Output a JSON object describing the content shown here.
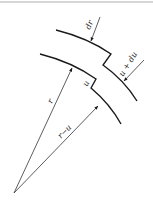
{
  "diagram": {
    "type": "radial-displacement",
    "labels": {
      "dr": "dr",
      "u_plus_du": "u + du",
      "u": "u",
      "r": "r",
      "r_minus_u": "r−u"
    },
    "colors": {
      "stroke": "#1a1a1a",
      "thin": "#333333",
      "top_border": "#c8c8c8",
      "background": "#ffffff"
    }
  }
}
